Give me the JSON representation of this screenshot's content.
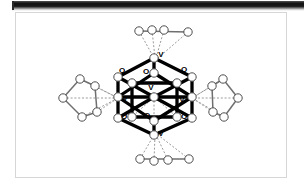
{
  "window": {
    "top_bar_name": "cut-off-toolbar-rule"
  },
  "figure": {
    "caption": "",
    "frame_border_color": "#d6d6d6",
    "background_color": "#ffffff"
  },
  "chart_data": {
    "type": "diagram",
    "title": "",
    "subtitle": "",
    "xlabel": "",
    "ylabel": "",
    "legend": [],
    "atom_labels": [
      {
        "id": "V-top",
        "text": "V",
        "x": 160,
        "y": 56
      },
      {
        "id": "O-upper-left",
        "text": "O",
        "x": 121,
        "y": 72
      },
      {
        "id": "O-upper-mid",
        "text": "O",
        "x": 145,
        "y": 73
      },
      {
        "id": "O-upper-right",
        "text": "O",
        "x": 183,
        "y": 71
      },
      {
        "id": "V-center-upper",
        "text": "V",
        "x": 150,
        "y": 89
      },
      {
        "id": "V-left",
        "text": "V",
        "x": 124,
        "y": 100
      },
      {
        "id": "V-right",
        "text": "V",
        "x": 181,
        "y": 101
      },
      {
        "id": "O-lower-left",
        "text": "O",
        "x": 123,
        "y": 118
      },
      {
        "id": "O-lower-mid",
        "text": "O",
        "x": 146,
        "y": 117
      },
      {
        "id": "O-lower-right",
        "text": "O",
        "x": 183,
        "y": 118
      },
      {
        "id": "V-bottom",
        "text": "V",
        "x": 160,
        "y": 135
      }
    ],
    "cage_vertices": [
      {
        "id": "v-apex-top",
        "x": 153,
        "y": 57
      },
      {
        "id": "v-apex-bottom",
        "x": 153,
        "y": 134
      },
      {
        "id": "v-left",
        "x": 117,
        "y": 97
      },
      {
        "id": "v-right",
        "x": 190,
        "y": 97
      },
      {
        "id": "o-nw",
        "x": 130,
        "y": 76
      },
      {
        "id": "o-ne",
        "x": 176,
        "y": 76
      },
      {
        "id": "o-sw",
        "x": 130,
        "y": 117
      },
      {
        "id": "o-se",
        "x": 176,
        "y": 117
      },
      {
        "id": "o-n",
        "x": 153,
        "y": 72
      },
      {
        "id": "o-s",
        "x": 153,
        "y": 121
      },
      {
        "id": "o-c",
        "x": 153,
        "y": 96
      }
    ],
    "ligands": [
      {
        "id": "ligand-top",
        "position": "top",
        "atom_count": 4,
        "shape": "chain"
      },
      {
        "id": "ligand-bottom",
        "position": "bottom",
        "atom_count": 4,
        "shape": "chain"
      },
      {
        "id": "ligand-left",
        "position": "left",
        "atom_count": 5,
        "shape": "ring"
      },
      {
        "id": "ligand-right",
        "position": "right",
        "atom_count": 5,
        "shape": "ring"
      }
    ],
    "style": {
      "bond_color": "#000000",
      "dashed_bond_color": "#9a9a9a",
      "atom_fill": "#ffffff",
      "atom_stroke": "#555555"
    }
  }
}
